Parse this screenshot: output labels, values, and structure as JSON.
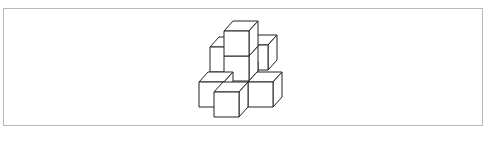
{
  "figure": {
    "stroke_color": "#222222",
    "fill_color": "#ffffff",
    "frame_color": "#b8b8b8",
    "cube_count": 8,
    "cubes": [
      {
        "id": "left-back-mid",
        "col": 0,
        "row": 1,
        "depth": 1
      },
      {
        "id": "right-back-mid",
        "col": 2,
        "row": 1,
        "depth": 1
      },
      {
        "id": "center-back-bottom",
        "col": 1,
        "row": 0,
        "depth": 1
      },
      {
        "id": "center-mid",
        "col": 1,
        "row": 1,
        "depth": 1
      },
      {
        "id": "center-top",
        "col": 1,
        "row": 2,
        "depth": 1
      },
      {
        "id": "left-bottom",
        "col": 0,
        "row": 0,
        "depth": 0
      },
      {
        "id": "right-bottom",
        "col": 2,
        "row": 0,
        "depth": 0
      },
      {
        "id": "front-center-bottom",
        "col": 1,
        "row": 0,
        "depth": -1
      }
    ]
  }
}
